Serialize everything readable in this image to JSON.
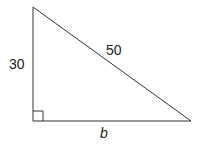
{
  "diagram": {
    "type": "right-triangle",
    "labels": {
      "vertical_leg": "30",
      "hypotenuse": "50",
      "horizontal_leg": "b"
    },
    "right_angle_marker": true,
    "stroke_color": "#333333"
  }
}
